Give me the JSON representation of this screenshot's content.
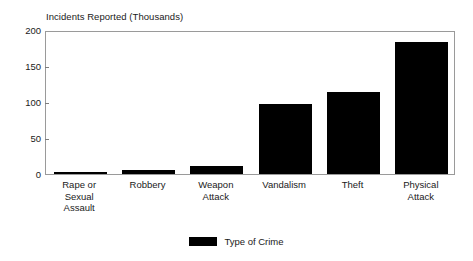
{
  "chart_data": {
    "type": "bar",
    "title": "Incidents Reported (Thousands)",
    "xlabel": "",
    "ylabel": "Incidents Reported (Thousands)",
    "categories": [
      "Rape or Sexual Assault",
      "Robbery",
      "Weapon Attack",
      "Vandalism",
      "Theft",
      "Physical Attack"
    ],
    "category_lines": [
      [
        "Rape or",
        "Sexual",
        "Assault"
      ],
      [
        "Robbery"
      ],
      [
        "Weapon",
        "Attack"
      ],
      [
        "Vandalism"
      ],
      [
        "Theft"
      ],
      [
        "Physical",
        "Attack"
      ]
    ],
    "values": [
      3,
      6,
      11,
      97,
      114,
      184
    ],
    "ylim": [
      0,
      200
    ],
    "yticks": [
      0,
      50,
      100,
      150,
      200
    ],
    "ytick_labels": [
      "0",
      "50",
      "100",
      "150",
      "200"
    ],
    "grid": false,
    "legend_position": "bottom",
    "legend": [
      {
        "label": "Type of Crime",
        "color": "#000000"
      }
    ],
    "series": [
      {
        "name": "Type of Crime",
        "color": "#000000",
        "values": [
          3,
          6,
          11,
          97,
          114,
          184
        ]
      }
    ],
    "colors": {
      "bar": "#000000",
      "frame": "#9a9a9a",
      "text": "#1a1a1a",
      "background": "#ffffff"
    }
  }
}
